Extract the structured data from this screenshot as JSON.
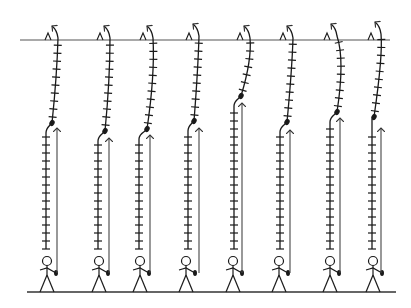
{
  "diagram": {
    "stroke_color": "#1a1a1a",
    "arrow_color": "#444444",
    "top_line": {
      "x1": 20,
      "x2": 390,
      "y": 40
    },
    "ground_line": {
      "x1": 27,
      "x2": 396,
      "y": 292
    },
    "figures": [
      {
        "person_x": 47,
        "lower_x": 46,
        "knot": [
          52,
          123
        ],
        "top": [
          55,
          26
        ],
        "mid": [
          57,
          75
        ],
        "arrow_x": 57,
        "arrow_tip": 128
      },
      {
        "person_x": 99,
        "lower_x": 98,
        "knot": [
          105,
          131
        ],
        "top": [
          107,
          26
        ],
        "mid": [
          110,
          80
        ],
        "arrow_x": 109,
        "arrow_tip": 138
      },
      {
        "person_x": 140,
        "lower_x": 139,
        "knot": [
          147,
          129
        ],
        "top": [
          150,
          26
        ],
        "mid": [
          155,
          75
        ],
        "arrow_x": 150,
        "arrow_tip": 135
      },
      {
        "person_x": 186,
        "lower_x": 188,
        "knot": [
          194,
          121
        ],
        "top": [
          196,
          24
        ],
        "mid": [
          198,
          70
        ],
        "arrow_x": 199,
        "arrow_tip": 128
      },
      {
        "person_x": 233,
        "lower_x": 234,
        "knot": [
          241,
          96
        ],
        "top": [
          247,
          26
        ],
        "mid": [
          252,
          60
        ],
        "arrow_x": 242,
        "arrow_tip": 103
      },
      {
        "person_x": 279,
        "lower_x": 280,
        "knot": [
          287,
          122
        ],
        "top": [
          290,
          26
        ],
        "mid": [
          292,
          70
        ],
        "arrow_x": 290,
        "arrow_tip": 130
      },
      {
        "person_x": 330,
        "lower_x": 330,
        "knot": [
          337,
          112
        ],
        "top": [
          334,
          24
        ],
        "mid": [
          345,
          60
        ],
        "arrow_x": 340,
        "arrow_tip": 118
      },
      {
        "person_x": 373,
        "lower_x": 372,
        "knot": [
          374,
          117
        ],
        "top": [
          378,
          22
        ],
        "mid": [
          383,
          55
        ],
        "arrow_x": 381,
        "arrow_tip": 128
      }
    ]
  }
}
